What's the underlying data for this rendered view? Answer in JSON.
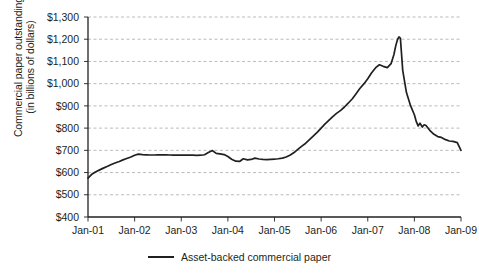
{
  "chart_data": {
    "type": "line",
    "title": "",
    "xlabel": "",
    "ylabel_line1": "Commercial paper outstanding",
    "ylabel_line2": "(in billions of dollars)",
    "ylim": [
      400,
      1300
    ],
    "ytick_labels": [
      "$1,300",
      "$1,200",
      "$1,100",
      "$1,000",
      "$900",
      "$800",
      "$700",
      "$600",
      "$500",
      "$400"
    ],
    "ytick_values": [
      1300,
      1200,
      1100,
      1000,
      900,
      800,
      700,
      600,
      500,
      400
    ],
    "xtick_labels": [
      "Jan-01",
      "Jan-02",
      "Jan-03",
      "Jan-04",
      "Jan-05",
      "Jan-06",
      "Jan-07",
      "Jan-08",
      "Jan-09"
    ],
    "xtick_values": [
      2001,
      2002,
      2003,
      2004,
      2005,
      2006,
      2007,
      2008,
      2009
    ],
    "xlim": [
      2001,
      2009
    ],
    "grid": "horizontal-dashed",
    "legend_position": "bottom-center",
    "line_color": "#231f20",
    "series": [
      {
        "name": "Asset-backed commercial paper",
        "x": [
          2001.0,
          2001.08,
          2001.17,
          2001.25,
          2001.33,
          2001.42,
          2001.5,
          2001.58,
          2001.67,
          2001.75,
          2001.83,
          2001.92,
          2002.0,
          2002.08,
          2002.17,
          2002.25,
          2002.33,
          2002.42,
          2002.5,
          2002.58,
          2002.67,
          2002.75,
          2002.83,
          2002.92,
          2003.0,
          2003.08,
          2003.17,
          2003.25,
          2003.33,
          2003.42,
          2003.5,
          2003.58,
          2003.67,
          2003.75,
          2003.83,
          2003.92,
          2004.0,
          2004.08,
          2004.17,
          2004.25,
          2004.33,
          2004.42,
          2004.5,
          2004.58,
          2004.67,
          2004.75,
          2004.83,
          2004.92,
          2005.0,
          2005.08,
          2005.17,
          2005.25,
          2005.33,
          2005.42,
          2005.5,
          2005.58,
          2005.67,
          2005.75,
          2005.83,
          2005.92,
          2006.0,
          2006.08,
          2006.17,
          2006.25,
          2006.33,
          2006.42,
          2006.5,
          2006.58,
          2006.67,
          2006.75,
          2006.83,
          2006.92,
          2007.0,
          2007.08,
          2007.17,
          2007.25,
          2007.33,
          2007.42,
          2007.5,
          2007.56,
          2007.6,
          2007.64,
          2007.67,
          2007.7,
          2007.75,
          2007.83,
          2007.92,
          2008.0,
          2008.04,
          2008.08,
          2008.12,
          2008.17,
          2008.21,
          2008.25,
          2008.33,
          2008.42,
          2008.5,
          2008.58,
          2008.67,
          2008.75,
          2008.83,
          2008.92,
          2009.0
        ],
        "values": [
          575,
          592,
          604,
          612,
          620,
          628,
          636,
          643,
          650,
          657,
          663,
          670,
          678,
          683,
          681,
          680,
          679,
          679,
          680,
          680,
          680,
          679,
          678,
          678,
          678,
          678,
          679,
          678,
          677,
          678,
          680,
          690,
          699,
          686,
          684,
          681,
          672,
          660,
          651,
          650,
          662,
          657,
          659,
          665,
          661,
          659,
          658,
          659,
          660,
          662,
          665,
          670,
          678,
          690,
          704,
          718,
          732,
          748,
          764,
          782,
          800,
          818,
          836,
          852,
          866,
          880,
          895,
          912,
          932,
          955,
          978,
          1000,
          1022,
          1048,
          1072,
          1085,
          1078,
          1072,
          1090,
          1130,
          1170,
          1200,
          1210,
          1205,
          1060,
          960,
          900,
          860,
          830,
          810,
          822,
          805,
          815,
          812,
          790,
          772,
          762,
          758,
          748,
          742,
          740,
          735,
          700
        ]
      }
    ]
  },
  "legend": {
    "label": "Asset-backed commercial paper"
  }
}
